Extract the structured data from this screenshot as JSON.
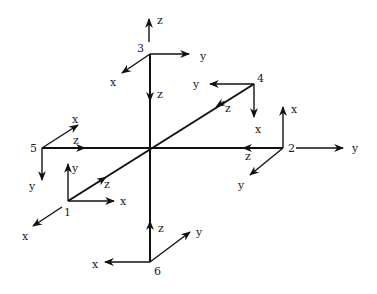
{
  "diagram": {
    "center": [
      150,
      148
    ],
    "main_axes": [
      {
        "name": "vertical-axis",
        "from": [
          150,
          54
        ],
        "to": [
          150,
          262
        ]
      },
      {
        "name": "horizontal-axis",
        "from": [
          42,
          148
        ],
        "to": [
          283,
          148
        ]
      },
      {
        "name": "diagonal-axis",
        "from": [
          68,
          201
        ],
        "to": [
          254,
          84
        ]
      }
    ],
    "nodes": [
      {
        "id": "1",
        "label": "1",
        "pos": [
          68,
          201
        ],
        "label_pos": [
          64,
          216
        ],
        "axes": [
          {
            "label": "x",
            "to": [
              114,
              201
            ],
            "label_pos": [
              120,
              205
            ]
          },
          {
            "label": "y",
            "to": [
              68,
              164
            ],
            "label_pos": [
              72,
              172
            ]
          },
          {
            "label": "x",
            "from": [
              62,
              207
            ],
            "to": [
              33,
              226
            ],
            "label_pos": [
              22,
              240
            ]
          },
          {
            "label": "z",
            "mid_arrow": [
              100,
              181
            ],
            "label_pos": [
              104,
              188
            ]
          }
        ]
      },
      {
        "id": "2",
        "label": "2",
        "pos": [
          283,
          148
        ],
        "label_pos": [
          288,
          152
        ],
        "axes": [
          {
            "label": "y",
            "from": [
              296,
              148
            ],
            "to": [
              343,
              148
            ],
            "label_pos": [
              352,
              152
            ]
          },
          {
            "label": "x",
            "to": [
              283,
              107
            ],
            "label_pos": [
              291,
              113
            ]
          },
          {
            "label": "y",
            "to": [
              250,
              175
            ],
            "label_pos": [
              238,
              189
            ]
          },
          {
            "label": "z",
            "mid_arrow": [
              250,
              148
            ],
            "label_pos": [
              245,
              160
            ]
          }
        ]
      },
      {
        "id": "3",
        "label": "3",
        "pos": [
          150,
          54
        ],
        "label_pos": [
          137,
          52
        ],
        "axes": [
          {
            "label": "z",
            "from": [
              149,
              42
            ],
            "to": [
              149,
              19
            ],
            "label_pos": [
              157,
              24
            ]
          },
          {
            "label": "y",
            "to": [
              189,
              54
            ],
            "label_pos": [
              200,
              60
            ]
          },
          {
            "label": "x",
            "to": [
              122,
              73
            ],
            "label_pos": [
              110,
              86
            ]
          },
          {
            "label": "z",
            "mid_arrow": [
              150,
              94
            ],
            "label_pos": [
              157,
              98
            ]
          }
        ]
      },
      {
        "id": "4",
        "label": "4",
        "pos": [
          254,
          84
        ],
        "label_pos": [
          257,
          82
        ],
        "axes": [
          {
            "label": "y",
            "to": [
              210,
              84
            ],
            "label_pos": [
              193,
              88
            ]
          },
          {
            "label": "x",
            "to": [
              254,
              117
            ],
            "label_pos": [
              255,
              133
            ]
          },
          {
            "label": "z",
            "mid_arrow": [
              222,
              103
            ],
            "label_pos": [
              225,
              112
            ]
          }
        ]
      },
      {
        "id": "5",
        "label": "5",
        "pos": [
          42,
          148
        ],
        "label_pos": [
          30,
          152
        ],
        "axes": [
          {
            "label": "x",
            "to": [
              78,
              125
            ],
            "label_pos": [
              72,
              123
            ]
          },
          {
            "label": "y",
            "to": [
              42,
              180
            ],
            "label_pos": [
              29,
              190
            ]
          },
          {
            "label": "z",
            "mid_arrow": [
              78,
              148
            ],
            "label_pos": [
              73,
              144
            ]
          }
        ]
      },
      {
        "id": "6",
        "label": "6",
        "pos": [
          150,
          262
        ],
        "label_pos": [
          154,
          275
        ],
        "axes": [
          {
            "label": "x",
            "to": [
              105,
              262
            ],
            "label_pos": [
              92,
              268
            ]
          },
          {
            "label": "y",
            "to": [
              190,
              232
            ],
            "label_pos": [
              196,
              236
            ]
          },
          {
            "label": "z",
            "mid_arrow": [
              150,
              228
            ],
            "label_pos": [
              158,
              232
            ]
          }
        ]
      }
    ]
  }
}
